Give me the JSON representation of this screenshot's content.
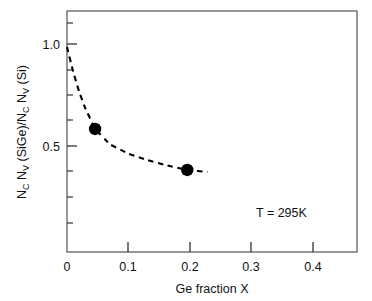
{
  "chart_data": {
    "type": "scatter",
    "title": "",
    "xlabel": "Ge fraction X",
    "ylabel": "N_C N_V (SiGe)/N_C N_V (Si)",
    "ylabel_parts": {
      "n1": "N",
      "sub1": "C",
      "n2": " N",
      "sub2": "V",
      "mid": " (SiGe)/N",
      "sub3": "C",
      "n3": " N",
      "sub4": "V",
      "tail": " (Si)"
    },
    "xlim": [
      0,
      0.475
    ],
    "ylim": [
      0.0,
      1.175
    ],
    "grid": false,
    "legend": false,
    "xticks": [
      0,
      0.1,
      0.2,
      0.3,
      0.4
    ],
    "xticklabels": [
      "0",
      "0.1",
      "0.2",
      "0.3",
      "0.4"
    ],
    "yticks": [
      0.5,
      1.0
    ],
    "yticklabels": [
      "0.5",
      "1.0"
    ],
    "yminorticks": [
      0.125,
      0.25,
      0.375,
      0.625,
      0.75,
      0.875,
      1.125
    ],
    "series": [
      {
        "name": "measured points",
        "marker": "filled-circle",
        "color": "#000000",
        "x": [
          0.046,
          0.197
        ],
        "y": [
          0.6,
          0.4
        ]
      },
      {
        "name": "model curve",
        "style": "dashed",
        "color": "#000000",
        "x": [
          0.0,
          0.01,
          0.02,
          0.03,
          0.046,
          0.07,
          0.1,
          0.13,
          0.16,
          0.197,
          0.23
        ],
        "y": [
          1.0,
          0.88,
          0.78,
          0.7,
          0.6,
          0.525,
          0.48,
          0.45,
          0.425,
          0.4,
          0.39
        ]
      }
    ],
    "annotations": [
      {
        "id": "temperature",
        "text": "T = 295K",
        "x": 0.335,
        "y": 0.21
      }
    ]
  }
}
